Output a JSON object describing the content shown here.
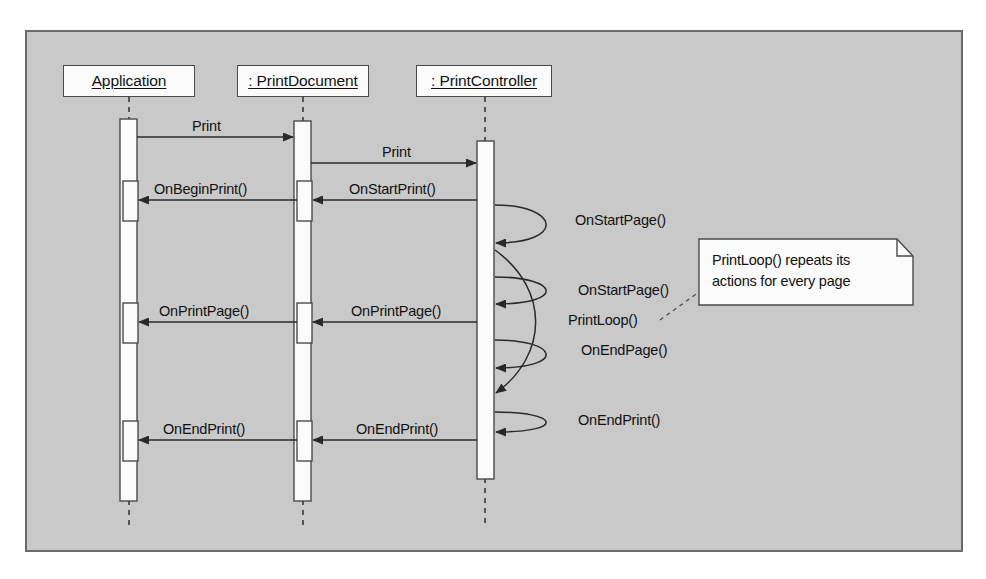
{
  "diagram": {
    "type": "uml-sequence-diagram",
    "background_color": "#c9c9c9",
    "frame_border_color": "#6b6b6b",
    "box_fill_color": "#fbfbfb",
    "line_color": "#333333",
    "lifelines": [
      {
        "id": "application",
        "label": "Application",
        "x": 129
      },
      {
        "id": "printdocument",
        "label": ": PrintDocument",
        "x": 303
      },
      {
        "id": "printcontroller",
        "label": ": PrintController",
        "x": 485
      }
    ],
    "messages": [
      {
        "id": "m1",
        "label": "Print",
        "from": "application",
        "to": "printdocument",
        "direction": "right",
        "y": 137
      },
      {
        "id": "m2",
        "label": "Print",
        "from": "printdocument",
        "to": "printcontroller",
        "direction": "right",
        "y": 163
      },
      {
        "id": "m3",
        "label": "OnStartPrint()",
        "from": "printcontroller",
        "to": "printdocument",
        "direction": "left",
        "y": 200
      },
      {
        "id": "m4",
        "label": "OnBeginPrint()",
        "from": "printdocument",
        "to": "application",
        "direction": "left",
        "y": 200
      },
      {
        "id": "m5",
        "label": "OnPrintPage()",
        "from": "printcontroller",
        "to": "printdocument",
        "direction": "left",
        "y": 322
      },
      {
        "id": "m6",
        "label": "OnPrintPage()",
        "from": "printdocument",
        "to": "application",
        "direction": "left",
        "y": 322
      },
      {
        "id": "m7",
        "label": "OnEndPrint()",
        "from": "printcontroller",
        "to": "printdocument",
        "direction": "left",
        "y": 440
      },
      {
        "id": "m8",
        "label": "OnEndPrint()",
        "from": "printdocument",
        "to": "application",
        "direction": "left",
        "y": 440
      }
    ],
    "self_messages": [
      {
        "id": "s1",
        "label": "OnStartPage()",
        "on": "printcontroller",
        "y": 222
      },
      {
        "id": "s2",
        "label": "OnStartPage()",
        "on": "printcontroller",
        "y": 292
      },
      {
        "id": "s3",
        "label": "PrintLoop()",
        "on": "printcontroller",
        "y": 322
      },
      {
        "id": "s4",
        "label": "OnEndPage()",
        "on": "printcontroller",
        "y": 352
      },
      {
        "id": "s5",
        "label": "OnEndPrint()",
        "on": "printcontroller",
        "y": 422
      }
    ],
    "note": {
      "id": "printloop-note",
      "lines": [
        "PrintLoop() repeats its",
        "actions for every page"
      ],
      "attached_to": "PrintLoop()"
    }
  }
}
